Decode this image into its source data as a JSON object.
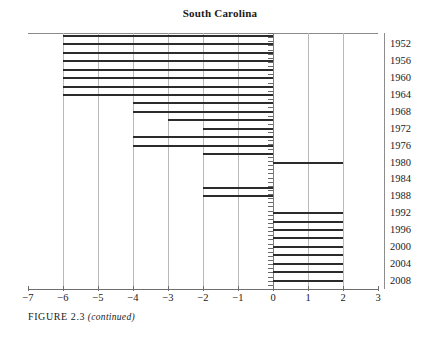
{
  "chart_data": {
    "type": "bar",
    "orientation": "horizontal",
    "title": "South Carolina",
    "xlabel": "",
    "ylabel": "",
    "xlim": [
      -7,
      3
    ],
    "ylim_years": [
      1950,
      2008
    ],
    "grid": true,
    "legend": null,
    "x_ticks": [
      -7,
      -6,
      -5,
      -4,
      -3,
      -2,
      -1,
      0,
      1,
      2,
      3
    ],
    "x_tick_labels": [
      "−7",
      "−6",
      "−5",
      "−4",
      "−3",
      "−2",
      "−1",
      "0",
      "1",
      "2",
      "3"
    ],
    "y_tick_labels": [
      "1952",
      "1956",
      "1960",
      "1964",
      "1968",
      "1972",
      "1976",
      "1980",
      "1984",
      "1988",
      "1992",
      "1996",
      "2000",
      "2004",
      "2008"
    ],
    "y_tick_years": [
      1952,
      1956,
      1960,
      1964,
      1968,
      1972,
      1976,
      1980,
      1984,
      1988,
      1992,
      1996,
      2000,
      2004,
      2008
    ],
    "categories": [
      1950,
      1952,
      1954,
      1956,
      1958,
      1960,
      1962,
      1964,
      1966,
      1968,
      1970,
      1972,
      1974,
      1976,
      1978,
      1980,
      1982,
      1984,
      1986,
      1988,
      1990,
      1992,
      1994,
      1996,
      1998,
      2000,
      2002,
      2004,
      2006,
      2008
    ],
    "values": [
      -6,
      -6,
      -6,
      -6,
      -6,
      -6,
      -6,
      -6,
      -4,
      -4,
      -3,
      -2,
      -4,
      -4,
      -2,
      2,
      0,
      0,
      -2,
      -2,
      0,
      2,
      2,
      2,
      2,
      2,
      2,
      2,
      2,
      2
    ],
    "bars": [
      {
        "year": 1950,
        "start": -6,
        "end": 0
      },
      {
        "year": 1952,
        "start": -6,
        "end": 0
      },
      {
        "year": 1954,
        "start": -6,
        "end": 0
      },
      {
        "year": 1956,
        "start": -6,
        "end": 0
      },
      {
        "year": 1958,
        "start": -6,
        "end": 0
      },
      {
        "year": 1960,
        "start": -6,
        "end": 0
      },
      {
        "year": 1962,
        "start": -6,
        "end": 0
      },
      {
        "year": 1964,
        "start": -6,
        "end": 0
      },
      {
        "year": 1966,
        "start": -4,
        "end": 0
      },
      {
        "year": 1968,
        "start": -4,
        "end": 0
      },
      {
        "year": 1970,
        "start": -3,
        "end": 0
      },
      {
        "year": 1972,
        "start": -2,
        "end": 0
      },
      {
        "year": 1974,
        "start": -4,
        "end": 0
      },
      {
        "year": 1976,
        "start": -4,
        "end": 0
      },
      {
        "year": 1978,
        "start": -2,
        "end": 0
      },
      {
        "year": 1980,
        "start": 0,
        "end": 2
      },
      {
        "year": 1986,
        "start": -2,
        "end": 0
      },
      {
        "year": 1988,
        "start": -2,
        "end": 0
      },
      {
        "year": 1992,
        "start": 0,
        "end": 2
      },
      {
        "year": 1994,
        "start": 0,
        "end": 2
      },
      {
        "year": 1996,
        "start": 0,
        "end": 2
      },
      {
        "year": 1998,
        "start": 0,
        "end": 2
      },
      {
        "year": 2000,
        "start": 0,
        "end": 2
      },
      {
        "year": 2002,
        "start": 0,
        "end": 2
      },
      {
        "year": 2004,
        "start": 0,
        "end": 2
      },
      {
        "year": 2006,
        "start": 0,
        "end": 2
      },
      {
        "year": 2008,
        "start": 0,
        "end": 2
      }
    ],
    "colors": {
      "bar": "#2b2b2b",
      "grid": "#b9b9b9",
      "axis": "#6e6e6e",
      "text": "#1a1a1a"
    }
  },
  "caption": {
    "label": "FIGURE 2.3",
    "note": "(continued)"
  }
}
